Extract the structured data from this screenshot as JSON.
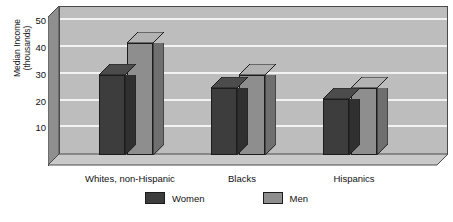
{
  "chart_data": {
    "type": "bar",
    "title": "",
    "subtitle": "",
    "xlabel": "",
    "ylabel": "Median Income\n(thousands)",
    "categories": [
      "Whites, non-Hispanic",
      "Blacks",
      "Hispanics"
    ],
    "series": [
      {
        "name": "Women",
        "color": "#3d3d3d",
        "values": [
          30,
          25,
          21
        ]
      },
      {
        "name": "Men",
        "color": "#8e8e8e",
        "values": [
          42,
          30,
          25
        ]
      }
    ],
    "ylim": [
      0,
      55
    ],
    "yticks": [
      10,
      20,
      30,
      40,
      50
    ],
    "grid": true,
    "legend_position": "bottom",
    "style": "3d-bar",
    "plot_background": "#bdbdbd",
    "gridline_color": "#f2f2f2",
    "axis_color": "#4a4a4a"
  },
  "legend": {
    "items": [
      {
        "label": "Women",
        "color": "#3d3d3d"
      },
      {
        "label": "Men",
        "color": "#8e8e8e"
      }
    ]
  }
}
